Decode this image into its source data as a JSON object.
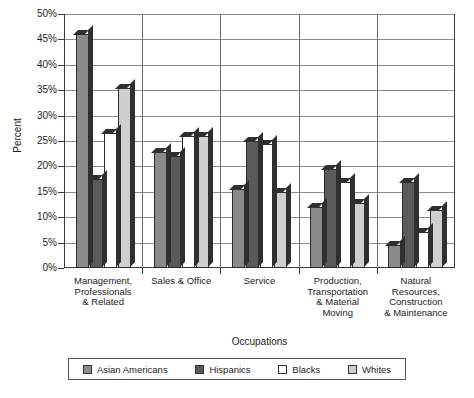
{
  "chart_data": {
    "type": "bar",
    "title": "",
    "xlabel": "Occupations",
    "ylabel": "Percent",
    "ylim": [
      0,
      50
    ],
    "ytick_step": 5,
    "ytick_labels": [
      "0%",
      "5%",
      "10%",
      "15%",
      "20%",
      "25%",
      "30%",
      "35%",
      "40%",
      "45%",
      "50%"
    ],
    "grid": true,
    "legend_position": "bottom",
    "categories": [
      "Management, Professionals & Related",
      "Sales & Office",
      "Service",
      "Production, Transportation & Material Moving",
      "Natural Resources, Construction & Maintenance"
    ],
    "category_lines": [
      [
        "Management,",
        "Professionals",
        "& Related"
      ],
      [
        "Sales & Office"
      ],
      [
        "Service"
      ],
      [
        "Production,",
        "Transportation",
        "& Material",
        "Moving"
      ],
      [
        "Natural",
        "Resources,",
        "Construction",
        "& Maintenance"
      ]
    ],
    "series": [
      {
        "name": "Asian Americans",
        "color": "#8a8a8a",
        "values": [
          46.0,
          22.8,
          15.5,
          12.0,
          4.5
        ]
      },
      {
        "name": "Hispanics",
        "color": "#5a5a5a",
        "values": [
          17.5,
          22.0,
          25.0,
          19.5,
          17.0
        ]
      },
      {
        "name": "Blacks",
        "color": "#ffffff",
        "values": [
          26.5,
          26.0,
          24.5,
          17.0,
          7.0
        ]
      },
      {
        "name": "Whites",
        "color": "#cfcfcf",
        "values": [
          35.5,
          26.0,
          15.0,
          12.8,
          11.5
        ]
      }
    ]
  },
  "legend": {
    "items": [
      {
        "label": "Asian Americans"
      },
      {
        "label": "Hispanics"
      },
      {
        "label": "Blacks"
      },
      {
        "label": "Whites"
      }
    ]
  },
  "axis_titles": {
    "y": "Percent",
    "x": "Occupations"
  }
}
